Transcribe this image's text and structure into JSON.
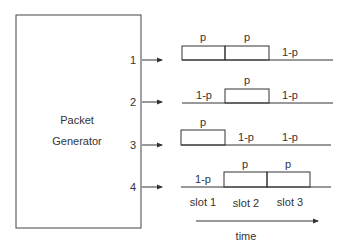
{
  "generator": {
    "line1": "Packet",
    "line2": "Generator"
  },
  "outputs": [
    {
      "port": "1",
      "slots": [
        "p",
        "p",
        "1-p"
      ]
    },
    {
      "port": "2",
      "slots": [
        "1-p",
        "p",
        "1-p"
      ]
    },
    {
      "port": "3",
      "slots": [
        "p",
        "1-p",
        "1-p"
      ]
    },
    {
      "port": "4",
      "slots": [
        "1-p",
        "p",
        "p"
      ]
    }
  ],
  "slot_labels": [
    "slot 1",
    "slot 2",
    "slot 3"
  ],
  "time_label": "time"
}
